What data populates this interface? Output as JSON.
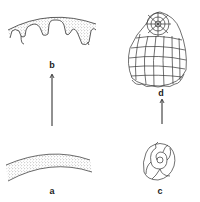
{
  "figure": {
    "panels": [
      {
        "id": "a",
        "label": "a",
        "description": "smooth curved stippled wall segment"
      },
      {
        "id": "b",
        "label": "b",
        "description": "curved stippled wall with deep scalloped folds"
      },
      {
        "id": "c",
        "label": "c",
        "description": "small coiled spiral shell"
      },
      {
        "id": "d",
        "label": "d",
        "description": "large many-chambered shell with reticulate pattern"
      }
    ],
    "arrows": [
      {
        "from": "a",
        "to": "b"
      },
      {
        "from": "c",
        "to": "d"
      }
    ],
    "colors": {
      "line": "#333333",
      "stipple": "#777777",
      "background": "#ffffff"
    }
  }
}
